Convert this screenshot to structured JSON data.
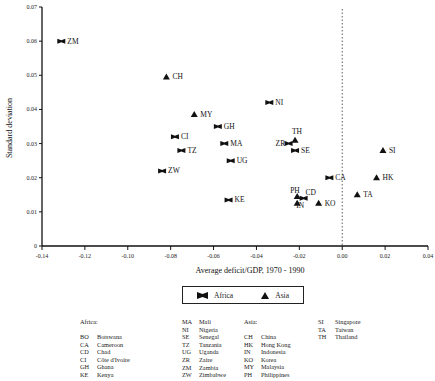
{
  "chart_data": {
    "type": "scatter",
    "title": "",
    "xlabel": "Average deficit/GDP, 1970 - 1990",
    "ylabel": "Standard deviation",
    "xlim": [
      -0.14,
      0.04
    ],
    "ylim": [
      0,
      0.07
    ],
    "x_ticks": [
      "-0.14",
      "-0.12",
      "-0.10",
      "-0.08",
      "-0.06",
      "-0.04",
      "-0.02",
      "0.00",
      "0.02",
      "0.04"
    ],
    "y_ticks": [
      "0",
      "0.01",
      "0.02",
      "0.03",
      "0.04",
      "0.05",
      "0.06",
      "0.07"
    ],
    "grid": false,
    "reference_line": {
      "x": 0.0,
      "style": "dotted"
    },
    "legend_position": "bottom",
    "series": [
      {
        "name": "Africa",
        "marker": "bowtie",
        "points": [
          {
            "label": "ZM",
            "x": -0.131,
            "y": 0.06
          },
          {
            "label": "NI",
            "x": -0.034,
            "y": 0.042
          },
          {
            "label": "GH",
            "x": -0.058,
            "y": 0.035
          },
          {
            "label": "CI",
            "x": -0.078,
            "y": 0.032
          },
          {
            "label": "MA",
            "x": -0.055,
            "y": 0.03
          },
          {
            "label": "TZ",
            "x": -0.075,
            "y": 0.028
          },
          {
            "label": "ZR",
            "x": -0.025,
            "y": 0.03
          },
          {
            "label": "SE",
            "x": -0.022,
            "y": 0.028
          },
          {
            "label": "UG",
            "x": -0.052,
            "y": 0.025
          },
          {
            "label": "ZW",
            "x": -0.084,
            "y": 0.022
          },
          {
            "label": "CA",
            "x": -0.006,
            "y": 0.02
          },
          {
            "label": "CD",
            "x": -0.018,
            "y": 0.014
          },
          {
            "label": "KE",
            "x": -0.053,
            "y": 0.0135
          }
        ]
      },
      {
        "name": "Asia",
        "marker": "triangle",
        "points": [
          {
            "label": "CH",
            "x": -0.082,
            "y": 0.0495
          },
          {
            "label": "MY",
            "x": -0.069,
            "y": 0.0385
          },
          {
            "label": "TH",
            "x": -0.022,
            "y": 0.031
          },
          {
            "label": "SI",
            "x": 0.019,
            "y": 0.028
          },
          {
            "label": "HK",
            "x": 0.016,
            "y": 0.02
          },
          {
            "label": "TA",
            "x": 0.007,
            "y": 0.015
          },
          {
            "label": "PH",
            "x": -0.021,
            "y": 0.0145
          },
          {
            "label": "IN",
            "x": -0.021,
            "y": 0.0125
          },
          {
            "label": "KO",
            "x": -0.011,
            "y": 0.0125
          }
        ]
      }
    ]
  },
  "legend": {
    "africa": "Africa",
    "asia": "Asia"
  },
  "key": {
    "africa_title": "Africa:",
    "asia_title": "Asia:",
    "africa_col1": [
      {
        "code": "BO",
        "name": "Botswana"
      },
      {
        "code": "CA",
        "name": "Cameroon"
      },
      {
        "code": "CD",
        "name": "Chad"
      },
      {
        "code": "CI",
        "name": "Côte d'Ivoire"
      },
      {
        "code": "GH",
        "name": "Ghana"
      },
      {
        "code": "KE",
        "name": "Kenya"
      }
    ],
    "africa_col2": [
      {
        "code": "MA",
        "name": "Mali"
      },
      {
        "code": "NI",
        "name": "Nigeria"
      },
      {
        "code": "SE",
        "name": "Senegal"
      },
      {
        "code": "TZ",
        "name": "Tanzania"
      },
      {
        "code": "UG",
        "name": "Uganda"
      },
      {
        "code": "ZR",
        "name": "Zaire"
      },
      {
        "code": "ZM",
        "name": "Zambia"
      },
      {
        "code": "ZW",
        "name": "Zimbabwe"
      }
    ],
    "asia_col1": [
      {
        "code": "CH",
        "name": "China"
      },
      {
        "code": "HK",
        "name": "Hong Kong"
      },
      {
        "code": "IN",
        "name": "Indonesia"
      },
      {
        "code": "KO",
        "name": "Korea"
      },
      {
        "code": "MY",
        "name": "Malaysia"
      },
      {
        "code": "PH",
        "name": "Philippines"
      }
    ],
    "asia_col2": [
      {
        "code": "SI",
        "name": "Singapore"
      },
      {
        "code": "TA",
        "name": "Taiwan"
      },
      {
        "code": "TH",
        "name": "Thailand"
      }
    ]
  }
}
